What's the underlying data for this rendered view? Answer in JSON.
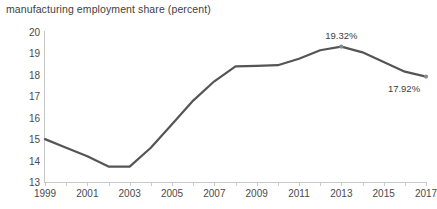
{
  "chart_data": {
    "type": "line",
    "title": "manufacturing employment share (percent)",
    "xlabel": "",
    "ylabel": "",
    "xlim": [
      1999,
      2017
    ],
    "ylim": [
      13,
      20
    ],
    "yticks": [
      13,
      14,
      15,
      16,
      17,
      18,
      19,
      20
    ],
    "xticks": [
      1999,
      2000,
      2001,
      2002,
      2003,
      2004,
      2005,
      2006,
      2007,
      2008,
      2009,
      2010,
      2011,
      2012,
      2013,
      2014,
      2015,
      2016,
      2017
    ],
    "xtick_labels": [
      "1999",
      "",
      "2001",
      "",
      "2003",
      "",
      "2005",
      "",
      "2007",
      "",
      "2009",
      "",
      "2011",
      "",
      "2013",
      "",
      "2015",
      "",
      "2017"
    ],
    "grid": false,
    "legend": "none",
    "line_color": "#555555",
    "axis_color": "#c9c9c9",
    "text_color": "#3e3e3e",
    "x": [
      1999,
      2000,
      2001,
      2002,
      2003,
      2004,
      2005,
      2006,
      2007,
      2008,
      2009,
      2010,
      2011,
      2012,
      2013,
      2014,
      2015,
      2016,
      2017
    ],
    "values": [
      15.0,
      14.6,
      14.2,
      13.72,
      13.72,
      14.6,
      15.7,
      16.8,
      17.7,
      18.4,
      18.42,
      18.45,
      18.75,
      19.15,
      19.32,
      19.05,
      18.6,
      18.15,
      17.92
    ],
    "series": [
      {
        "name": "manufacturing employment share",
        "values": [
          15.0,
          14.6,
          14.2,
          13.72,
          13.72,
          14.6,
          15.7,
          16.8,
          17.7,
          18.4,
          18.42,
          18.45,
          18.75,
          19.15,
          19.32,
          19.05,
          18.6,
          18.15,
          17.92
        ]
      }
    ],
    "annotations": [
      {
        "name": "peak-value-label",
        "text": "19.32%",
        "x": 2013,
        "y": 19.32,
        "position": "above"
      },
      {
        "name": "end-value-label",
        "text": "17.92%",
        "x": 2017,
        "y": 17.92,
        "position": "below-left"
      }
    ],
    "markers": [
      {
        "name": "peak-marker",
        "x": 2013,
        "y": 19.32
      },
      {
        "name": "end-marker",
        "x": 2017,
        "y": 17.92
      }
    ]
  }
}
